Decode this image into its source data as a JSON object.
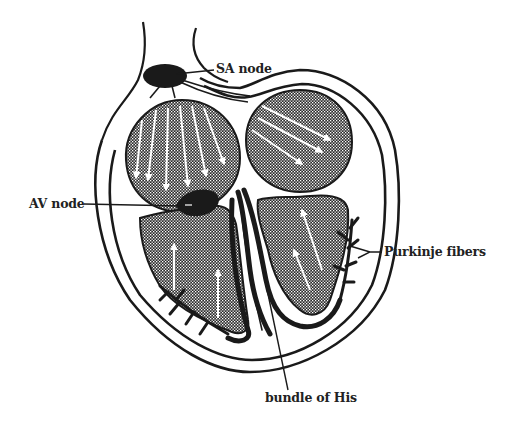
{
  "diagram": {
    "labels": {
      "sa_node": "SA node",
      "av_node": "AV node",
      "purkinje": "Purkinje fibers",
      "bundle_his": "bundle of His"
    },
    "colors": {
      "ink": "#1a1a1a",
      "stipple": "#2a2a2a",
      "background": "#ffffff",
      "arrows": "#ffffff",
      "label_text": "#222222"
    }
  }
}
